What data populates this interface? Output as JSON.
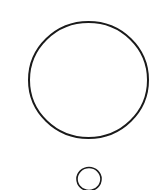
{
  "diagram": {
    "background": "#ffffff",
    "stroke_color": "#1a1a1a",
    "shapes": [
      {
        "id": "large-circle",
        "type": "circle",
        "cx": 88.5,
        "cy": 80,
        "rx": 59.5,
        "ry": 58,
        "stroke_width": 2
      },
      {
        "id": "small-circle",
        "type": "circle",
        "cx": 89,
        "cy": 179,
        "rx": 12,
        "ry": 11.5,
        "stroke_width": 1.6
      }
    ]
  }
}
